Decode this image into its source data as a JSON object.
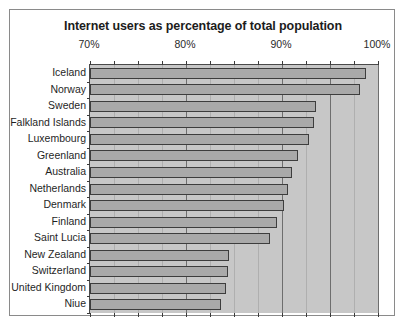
{
  "chart_data": {
    "type": "bar",
    "orientation": "horizontal",
    "title": "Internet users as percentage of total population",
    "xlabel": "",
    "ylabel": "",
    "xlim": [
      70,
      100
    ],
    "xticks": [
      70,
      80,
      90,
      100
    ],
    "xtick_labels": [
      "70%",
      "80%",
      "90%",
      "100%"
    ],
    "xtick_position": "top",
    "grid": true,
    "legend": false,
    "bar_color": "#a9a9a9",
    "bar_edge_color": "#3d3d3d",
    "plot_background": "#c7c7c7",
    "categories": [
      "Iceland",
      "Norway",
      "Sweden",
      "Falkland Islands",
      "Luxembourg",
      "Greenland",
      "Australia",
      "Netherlands",
      "Denmark",
      "Finland",
      "Saint Lucia",
      "New Zealand",
      "Switzerland",
      "United Kingdom",
      "Niue"
    ],
    "values": [
      98.7,
      98.1,
      93.5,
      93.3,
      92.8,
      91.7,
      91.0,
      90.6,
      90.2,
      89.5,
      88.8,
      84.5,
      84.4,
      84.2,
      83.6
    ]
  }
}
